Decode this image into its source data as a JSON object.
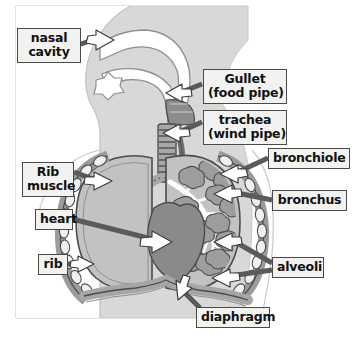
{
  "figure": {
    "width": 357,
    "height": 338,
    "background_color": "#ffffff",
    "body_tint_color": "#d8d8d6",
    "label_box_fill": "#f2f2f0",
    "label_box_border": "#4a4a4a",
    "label_text_color": "#111111",
    "arrow_fill_color": "#ffffff",
    "arrow_outline_color": "#3c3c3c",
    "pointer_bar_color": "#5a5a5a",
    "lung_fill_color": "#c2c2c0",
    "heart_fill_color": "#8a8a8a",
    "alveoli_fill_color": "#9d9d9b",
    "bronchial_tree_color": "#ffffff",
    "rib_fill_color": "#f0f0ee",
    "diaphragm_color": "#a6a6a4",
    "outline_color": "#4c4c4c"
  },
  "labels": [
    {
      "id": "nasal-cavity",
      "line1": "nasal",
      "line2": "cavity",
      "x": 17,
      "y": 28,
      "w": 64,
      "h": 33
    },
    {
      "id": "gullet",
      "line1": "Gullet",
      "line2": "(food pipe)",
      "x": 203,
      "y": 69,
      "w": 84,
      "h": 33
    },
    {
      "id": "trachea",
      "line1": "trachea",
      "line2": "(wind pipe)",
      "x": 203,
      "y": 110,
      "w": 84,
      "h": 33
    },
    {
      "id": "bronchiole",
      "line1": "bronchiole",
      "line2": "",
      "x": 268,
      "y": 148,
      "w": 82,
      "h": 21
    },
    {
      "id": "bronchus",
      "line1": "bronchus",
      "line2": "",
      "x": 272,
      "y": 190,
      "w": 75,
      "h": 21
    },
    {
      "id": "alveoli",
      "line1": "alveoli",
      "line2": "",
      "x": 272,
      "y": 257,
      "w": 52,
      "h": 21
    },
    {
      "id": "diaphragm",
      "line1": "diaphragm",
      "line2": "",
      "x": 196,
      "y": 307,
      "w": 74,
      "h": 21
    },
    {
      "id": "rib-muscle",
      "line1": "Rib",
      "line2": "muscle",
      "x": 22,
      "y": 162,
      "w": 52,
      "h": 33
    },
    {
      "id": "heart",
      "line1": "heart",
      "line2": "",
      "x": 35,
      "y": 209,
      "w": 38,
      "h": 21
    },
    {
      "id": "rib",
      "line1": "rib",
      "line2": "",
      "x": 38,
      "y": 254,
      "w": 30,
      "h": 21
    }
  ],
  "structures": [
    {
      "id": "nasal-cavity",
      "name": "nasal cavity"
    },
    {
      "id": "gullet",
      "name": "gullet (oesophagus)"
    },
    {
      "id": "trachea",
      "name": "trachea"
    },
    {
      "id": "bronchus",
      "name": "bronchus"
    },
    {
      "id": "bronchiole",
      "name": "bronchiole"
    },
    {
      "id": "alveoli",
      "name": "alveoli"
    },
    {
      "id": "left-lung",
      "name": "lung"
    },
    {
      "id": "right-lung",
      "name": "lung"
    },
    {
      "id": "heart",
      "name": "heart"
    },
    {
      "id": "rib",
      "name": "rib"
    },
    {
      "id": "rib-muscle",
      "name": "intercostal rib muscle"
    },
    {
      "id": "diaphragm",
      "name": "diaphragm"
    }
  ]
}
